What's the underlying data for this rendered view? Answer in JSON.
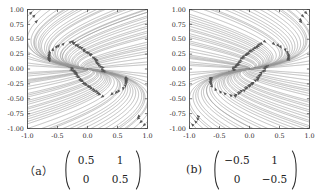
{
  "figure": {
    "background": "#ffffff",
    "line_color": "#9a9a9a",
    "arrow_color": "#555555",
    "axis_color": "#3c3c3c",
    "text_color": "#262626"
  },
  "panels": [
    {
      "id": "a",
      "caption_label": "（a）",
      "matrix": {
        "rows": [
          [
            "0.5",
            "1"
          ],
          [
            "0",
            "0.5"
          ]
        ]
      },
      "chart_data": {
        "type": "line",
        "title": "",
        "subtitle": "",
        "xlabel": "",
        "ylabel": "",
        "xlim": [
          -1.0,
          1.0
        ],
        "ylim": [
          -1.0,
          1.0
        ],
        "grid": false,
        "legend": "none",
        "plot_kind": "streamplot",
        "description": "Phase portrait of linear system x' = A x for A = [[0.5, 1], [0, 0.5]] (degenerate / improper unstable node, repeated eigenvalue 0.5, single eigenvector along the x-axis). Trajectories flow outward from the origin.",
        "matrix_values": [
          [
            0.5,
            1.0
          ],
          [
            0.0,
            0.5
          ]
        ],
        "eigenvalues": [
          0.5,
          0.5
        ],
        "eigenvector": [
          1,
          0
        ],
        "stability": "unstable",
        "flow_direction": "outward",
        "xticks": [
          -1.0,
          -0.5,
          0.0,
          0.5,
          1.0
        ],
        "xticklabels": [
          "-1.0",
          "-0.5",
          "0.0",
          "0.5",
          "1.0"
        ],
        "yticks": [
          -1.0,
          -0.75,
          -0.5,
          -0.25,
          0.0,
          0.25,
          0.5,
          0.75,
          1.0
        ],
        "yticklabels": [
          "-1.00",
          "-0.75",
          "-0.50",
          "-0.25",
          "0.00",
          "0.25",
          "0.50",
          "0.75",
          "1.00"
        ]
      }
    },
    {
      "id": "b",
      "caption_label": "(b)",
      "matrix": {
        "rows": [
          [
            "−0.5",
            "1"
          ],
          [
            "0",
            "−0.5"
          ]
        ]
      },
      "chart_data": {
        "type": "line",
        "title": "",
        "subtitle": "",
        "xlabel": "",
        "ylabel": "",
        "xlim": [
          -1.0,
          1.0
        ],
        "ylim": [
          -1.0,
          1.0
        ],
        "grid": false,
        "legend": "none",
        "plot_kind": "streamplot",
        "description": "Phase portrait of linear system x' = A x for A = [[-0.5, 1], [0, -0.5]] (degenerate / improper stable node, repeated eigenvalue -0.5, single eigenvector along the x-axis). Trajectories flow inward toward the origin.",
        "matrix_values": [
          [
            -0.5,
            1.0
          ],
          [
            0.0,
            -0.5
          ]
        ],
        "eigenvalues": [
          -0.5,
          -0.5
        ],
        "eigenvector": [
          1,
          0
        ],
        "stability": "stable",
        "flow_direction": "inward",
        "xticks": [
          -1.0,
          -0.5,
          0.0,
          0.5,
          1.0
        ],
        "xticklabels": [
          "-1.0",
          "-0.5",
          "0.0",
          "0.5",
          "1.0"
        ],
        "yticks": [
          -1.0,
          -0.75,
          -0.5,
          -0.25,
          0.0,
          0.25,
          0.5,
          0.75,
          1.0
        ],
        "yticklabels": [
          "-1.00",
          "-0.75",
          "-0.50",
          "-0.25",
          "0.00",
          "0.25",
          "0.50",
          "0.75",
          "1.00"
        ]
      }
    }
  ]
}
